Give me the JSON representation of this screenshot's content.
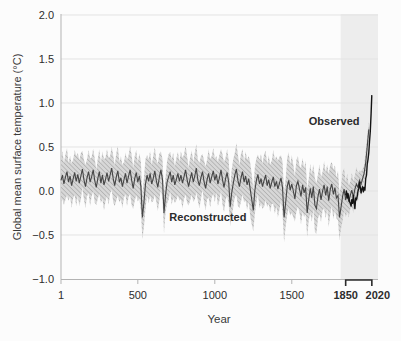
{
  "colors": {
    "background": "#fcfcfc",
    "grid": "#e3e3e3",
    "axis": "#b3b3b3",
    "highlight_band": "#ededed",
    "uncertainty_fill": "#d7d7d7",
    "uncertainty_hatch": "#9b9b9b",
    "reconstructed_line": "#454545",
    "observed_line": "#141414",
    "bracket": "#2b2b2b",
    "text": "#2d2d2d"
  },
  "chart_data": {
    "type": "line",
    "title": "",
    "xlabel": "Year",
    "ylabel": "Global mean surface temperature (°C)",
    "xlim": [
      1,
      2060
    ],
    "ylim": [
      -1.0,
      2.0
    ],
    "grid": true,
    "yticks": [
      {
        "value": 2.0,
        "label": "2.0"
      },
      {
        "value": 1.5,
        "label": "1.5"
      },
      {
        "value": 1.0,
        "label": "1.0"
      },
      {
        "value": 0.5,
        "label": "0.5"
      },
      {
        "value": 0.0,
        "label": "0.0"
      },
      {
        "value": -0.5,
        "label": "−0.5"
      },
      {
        "value": -1.0,
        "label": "−1.0"
      }
    ],
    "xticks": [
      {
        "value": 1,
        "label": "1",
        "bold": false,
        "dx": 0
      },
      {
        "value": 500,
        "label": "500",
        "bold": false,
        "dx": 0
      },
      {
        "value": 1000,
        "label": "1000",
        "bold": false,
        "dx": 0
      },
      {
        "value": 1500,
        "label": "1500",
        "bold": false,
        "dx": 0
      },
      {
        "value": 1850,
        "label": "1850",
        "bold": true,
        "dx": 0
      },
      {
        "value": 2020,
        "label": "2020",
        "bold": true,
        "dx": 6
      }
    ],
    "highlight_span": {
      "x0": 1850,
      "x1": 2020
    },
    "bracket_span": {
      "x0": 1850,
      "x1": 2020
    },
    "annotations": [
      {
        "text": "Observed",
        "x": 1775,
        "y": 0.8
      },
      {
        "text": "Reconstructed",
        "x": 955,
        "y": -0.3
      }
    ],
    "series": [
      {
        "name": "Reconstructed",
        "style": "line_with_hatched_band",
        "x_start": 0,
        "x_step": 10,
        "values": [
          0.12,
          0.18,
          0.08,
          0.16,
          0.22,
          0.1,
          0.17,
          0.06,
          0.14,
          0.21,
          0.11,
          0.19,
          0.09,
          0.17,
          0.25,
          0.13,
          0.05,
          0.15,
          0.22,
          0.1,
          0.16,
          0.24,
          0.12,
          0.04,
          0.14,
          0.22,
          0.09,
          0.18,
          0.07,
          0.13,
          0.21,
          0.11,
          0.18,
          0.26,
          0.14,
          0.06,
          0.16,
          0.23,
          0.1,
          0.15,
          0.05,
          0.13,
          0.2,
          0.09,
          0.17,
          0.24,
          0.12,
          0.03,
          0.14,
          0.21,
          0.1,
          0.17,
          0.05,
          -0.3,
          -0.12,
          0.08,
          0.18,
          0.11,
          0.2,
          0.08,
          0.14,
          0.23,
          0.12,
          0.04,
          0.16,
          0.24,
          0.13,
          -0.25,
          -0.05,
          0.1,
          0.16,
          0.22,
          0.1,
          0.18,
          0.07,
          0.13,
          0.2,
          0.11,
          0.18,
          0.09,
          0.16,
          0.24,
          0.13,
          0.05,
          0.14,
          0.21,
          0.1,
          0.17,
          0.26,
          0.12,
          0.06,
          0.15,
          0.22,
          0.11,
          0.03,
          0.13,
          0.2,
          0.09,
          0.16,
          0.23,
          0.12,
          0.19,
          0.08,
          0.15,
          0.24,
          0.13,
          0.04,
          0.14,
          0.21,
          0.1,
          -0.18,
          -0.02,
          0.09,
          0.18,
          0.25,
          0.12,
          0.05,
          0.15,
          0.22,
          0.1,
          0.17,
          0.07,
          0.14,
          0.02,
          -0.1,
          -0.22,
          0.0,
          0.12,
          0.19,
          0.08,
          0.14,
          0.05,
          0.12,
          0.18,
          0.06,
          0.13,
          0.03,
          0.1,
          0.16,
          0.05,
          0.11,
          0.02,
          0.09,
          0.15,
          0.04,
          -0.3,
          -0.14,
          0.05,
          0.12,
          0.01,
          0.08,
          0.0,
          -0.09,
          0.06,
          0.11,
          0.02,
          -0.06,
          0.07,
          -0.02,
          0.04,
          -0.25,
          -0.1,
          0.03,
          -0.08,
          0.05,
          -0.16,
          -0.2,
          -0.06,
          0.02,
          -0.1,
          0.0,
          0.07,
          -0.05,
          0.05,
          -0.11,
          0.02,
          0.08,
          -0.04,
          0.04,
          -0.08,
          -0.05,
          -0.3,
          -0.18,
          -0.06,
          0.02,
          -0.1,
          -0.02,
          -0.12,
          -0.05,
          0.01,
          -0.07,
          0.02,
          0.08,
          0.04,
          0.12,
          0.08,
          0.14,
          0.2,
          0.32,
          0.5,
          0.7
        ],
        "band_halfwidth_x_step": 100,
        "band_halfwidths": [
          0.24,
          0.25,
          0.23,
          0.26,
          0.24,
          0.26,
          0.25,
          0.23,
          0.26,
          0.24,
          0.25,
          0.26,
          0.27,
          0.26,
          0.29,
          0.3,
          0.28,
          0.26,
          0.27,
          0.17,
          0.1
        ]
      },
      {
        "name": "Observed",
        "style": "line",
        "x_start": 1850,
        "x_step": 5,
        "values": [
          -0.05,
          0.0,
          -0.08,
          -0.03,
          -0.07,
          -0.12,
          -0.14,
          -0.17,
          -0.1,
          -0.14,
          -0.05,
          -0.13,
          -0.2,
          -0.08,
          -0.1,
          -0.06,
          0.0,
          0.03,
          0.1,
          0.04,
          -0.02,
          0.02,
          0.05,
          -0.01,
          0.04,
          0.01,
          0.14,
          0.18,
          0.3,
          0.36,
          0.44,
          0.56,
          0.68,
          0.88,
          1.09
        ]
      }
    ]
  }
}
